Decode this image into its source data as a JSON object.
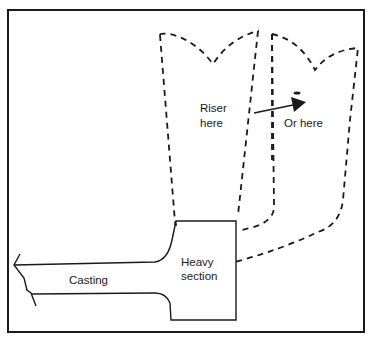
{
  "diagram": {
    "labels": {
      "riser_line1": "Riser",
      "riser_line2": "here",
      "alt_riser": "Or here",
      "heavy_line1": "Heavy",
      "heavy_line2": "section",
      "casting": "Casting"
    },
    "colors": {
      "line": "#1a1a1a",
      "background": "#ffffff"
    },
    "elements": [
      {
        "id": "frame",
        "style": "solid"
      },
      {
        "id": "casting",
        "style": "solid",
        "shape": "thin section with broken end"
      },
      {
        "id": "heavy-section",
        "style": "solid",
        "shape": "block"
      },
      {
        "id": "riser-primary",
        "style": "dashed",
        "position": "on top of heavy section"
      },
      {
        "id": "riser-alternative",
        "style": "dashed",
        "position": "beside heavy section"
      },
      {
        "id": "arrow",
        "style": "solid",
        "from": "riser-primary",
        "to": "riser-alternative"
      }
    ]
  }
}
